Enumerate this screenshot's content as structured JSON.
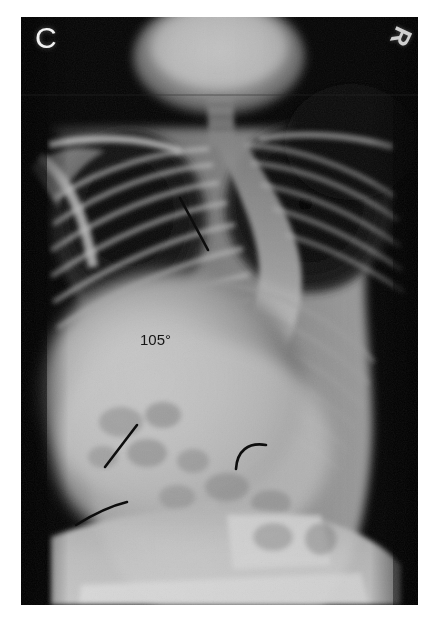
{
  "figure": {
    "panel_label": "C",
    "modality": "radiograph",
    "view": "full-spine anteroposterior",
    "background_color": "#ffffff",
    "film_background_color": "#000000"
  },
  "markers": {
    "laterality": {
      "text": "R",
      "color": "#cfcfcf",
      "rotation_degrees": 115
    }
  },
  "measurements": {
    "cobb_angle": {
      "value": "105",
      "unit": "°",
      "text": "105°",
      "color": "#151515"
    }
  },
  "annotations": {
    "lines": [
      {
        "name": "upper-endplate-line",
        "x1": 159,
        "y1": 181,
        "x2": 187,
        "y2": 233,
        "color": "#0d0d0d",
        "width": 2.6
      },
      {
        "name": "lower-endplate-line",
        "x1": 116,
        "y1": 408,
        "x2": 84,
        "y2": 450,
        "color": "#0d0d0d",
        "width": 2.6
      }
    ],
    "arcs": [
      {
        "name": "right-rib-hump-arc",
        "path": "M 215 452 C 216 434 227 425 245 428",
        "color": "#0d0d0d",
        "width": 2.6
      },
      {
        "name": "left-flank-arc",
        "path": "M 55 508 C 68 500 85 490 106 485",
        "color": "#0d0d0d",
        "width": 2.6
      }
    ]
  },
  "anatomy": {
    "regions": [
      "mandible",
      "cervical spine",
      "clavicle",
      "scapula",
      "thoracic ribs",
      "lung fields",
      "thoracolumbar spine",
      "iliac crest",
      "pelvis"
    ]
  }
}
